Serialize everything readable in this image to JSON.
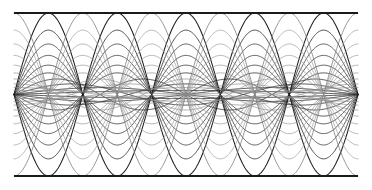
{
  "figure": {
    "name": "standing-wave-harmonic-superposition",
    "background_color": "#ffffff",
    "width": 372,
    "height": 190
  },
  "frame": {
    "top_label": "top boundary",
    "bottom_label": "bottom boundary",
    "color": "#1a1a1a",
    "stroke_width": 1.1,
    "x_left": 14,
    "x_right": 358,
    "y_top": 13,
    "y_bottom": 176,
    "left_border_visible": false,
    "right_border_visible": false
  },
  "chart_data": {
    "type": "line",
    "subtitle": "",
    "xlabel": "",
    "ylabel": "",
    "xlim": [
      0,
      1
    ],
    "ylim": [
      -1,
      1
    ],
    "grid": false,
    "legend": "none",
    "axes_visible": false,
    "tick_labels_x": [],
    "tick_labels_y": [],
    "domain_px": {
      "x0": 14,
      "x1": 358
    },
    "range_px": {
      "y_center": 94.5,
      "y_top": 13,
      "y_bottom": 176
    },
    "half_amplitude_px": 81.5,
    "equation": "y(x) = A_n * sin(n * pi * x / L)",
    "node_count_per_curve_note": "nodes shared at x = k*L/n",
    "samples_per_curve": 420,
    "series": [
      {
        "name": "harmonic-1-up",
        "n": 1,
        "amplitude": 0.05,
        "phase": 0,
        "color": "#262626",
        "width": 0.85,
        "opacity": 1.0
      },
      {
        "name": "harmonic-1-down",
        "n": 1,
        "amplitude": -0.05,
        "phase": 0,
        "color": "#262626",
        "width": 0.85,
        "opacity": 1.0
      },
      {
        "name": "harmonic-2-up",
        "n": 2,
        "amplitude": 0.085,
        "phase": 0,
        "color": "#2b2b2b",
        "width": 0.85,
        "opacity": 1.0
      },
      {
        "name": "harmonic-2-down",
        "n": 2,
        "amplitude": -0.085,
        "phase": 0,
        "color": "#2b2b2b",
        "width": 0.85,
        "opacity": 1.0
      },
      {
        "name": "harmonic-3-up",
        "n": 3,
        "amplitude": 0.13,
        "phase": 0,
        "color": "#303030",
        "width": 0.85,
        "opacity": 1.0
      },
      {
        "name": "harmonic-3-down",
        "n": 3,
        "amplitude": -0.13,
        "phase": 0,
        "color": "#303030",
        "width": 0.85,
        "opacity": 1.0
      },
      {
        "name": "harmonic-4-up",
        "n": 4,
        "amplitude": 0.19,
        "phase": 0,
        "color": "#343434",
        "width": 0.85,
        "opacity": 1.0
      },
      {
        "name": "harmonic-4-down",
        "n": 4,
        "amplitude": -0.19,
        "phase": 0,
        "color": "#343434",
        "width": 0.85,
        "opacity": 1.0
      },
      {
        "name": "harmonic-5-up",
        "n": 5,
        "amplitude": 0.265,
        "phase": 0,
        "color": "#383838",
        "width": 0.85,
        "opacity": 1.0
      },
      {
        "name": "harmonic-5-down",
        "n": 5,
        "amplitude": -0.265,
        "phase": 0,
        "color": "#383838",
        "width": 0.85,
        "opacity": 1.0
      },
      {
        "name": "harmonic-6-up",
        "n": 5,
        "amplitude": 0.36,
        "phase": 0,
        "color": "#3d3d3d",
        "width": 0.85,
        "opacity": 1.0
      },
      {
        "name": "harmonic-6-down",
        "n": 5,
        "amplitude": -0.36,
        "phase": 0,
        "color": "#3d3d3d",
        "width": 0.85,
        "opacity": 1.0
      },
      {
        "name": "harmonic-7-up",
        "n": 5,
        "amplitude": 0.48,
        "phase": 0,
        "color": "#414141",
        "width": 0.85,
        "opacity": 1.0
      },
      {
        "name": "harmonic-7-down",
        "n": 5,
        "amplitude": -0.48,
        "phase": 0,
        "color": "#414141",
        "width": 0.85,
        "opacity": 1.0
      },
      {
        "name": "harmonic-8-up",
        "n": 5,
        "amplitude": 0.62,
        "phase": 0,
        "color": "#454545",
        "width": 0.85,
        "opacity": 1.0
      },
      {
        "name": "harmonic-8-down",
        "n": 5,
        "amplitude": -0.62,
        "phase": 0,
        "color": "#454545",
        "width": 0.85,
        "opacity": 1.0
      },
      {
        "name": "harmonic-9-up",
        "n": 5,
        "amplitude": 0.79,
        "phase": 0,
        "color": "#3a3a3a",
        "width": 0.9,
        "opacity": 1.0
      },
      {
        "name": "harmonic-9-down",
        "n": 5,
        "amplitude": -0.79,
        "phase": 0,
        "color": "#3a3a3a",
        "width": 0.9,
        "opacity": 1.0
      },
      {
        "name": "harmonic-10-up",
        "n": 5,
        "amplitude": 1.0,
        "phase": 0,
        "color": "#1f1f1f",
        "width": 1.05,
        "opacity": 1.0
      },
      {
        "name": "harmonic-10-down",
        "n": 5,
        "amplitude": -1.0,
        "phase": 0,
        "color": "#1f1f1f",
        "width": 1.05,
        "opacity": 1.0
      },
      {
        "name": "shifted-1-up",
        "n": 1,
        "amplitude": 0.05,
        "phase": 0.5,
        "color": "#8a8a8a",
        "width": 0.8,
        "opacity": 0.95
      },
      {
        "name": "shifted-1-down",
        "n": 1,
        "amplitude": -0.05,
        "phase": 0.5,
        "color": "#8a8a8a",
        "width": 0.8,
        "opacity": 0.95
      },
      {
        "name": "shifted-2-up",
        "n": 2,
        "amplitude": 0.085,
        "phase": 0.5,
        "color": "#8d8d8d",
        "width": 0.8,
        "opacity": 0.95
      },
      {
        "name": "shifted-2-down",
        "n": 2,
        "amplitude": -0.085,
        "phase": 0.5,
        "color": "#8d8d8d",
        "width": 0.8,
        "opacity": 0.95
      },
      {
        "name": "shifted-3-up",
        "n": 3,
        "amplitude": 0.13,
        "phase": 0.5,
        "color": "#909090",
        "width": 0.8,
        "opacity": 0.95
      },
      {
        "name": "shifted-3-down",
        "n": 3,
        "amplitude": -0.13,
        "phase": 0.5,
        "color": "#909090",
        "width": 0.8,
        "opacity": 0.95
      },
      {
        "name": "shifted-4-up",
        "n": 4,
        "amplitude": 0.19,
        "phase": 0.5,
        "color": "#939393",
        "width": 0.8,
        "opacity": 0.95
      },
      {
        "name": "shifted-4-down",
        "n": 4,
        "amplitude": -0.19,
        "phase": 0.5,
        "color": "#939393",
        "width": 0.8,
        "opacity": 0.95
      },
      {
        "name": "shifted-5-up",
        "n": 5,
        "amplitude": 0.265,
        "phase": 0.5,
        "color": "#969696",
        "width": 0.8,
        "opacity": 0.95
      },
      {
        "name": "shifted-5-down",
        "n": 5,
        "amplitude": -0.265,
        "phase": 0.5,
        "color": "#969696",
        "width": 0.8,
        "opacity": 0.95
      },
      {
        "name": "shifted-6-up",
        "n": 5,
        "amplitude": 0.36,
        "phase": 0.5,
        "color": "#999999",
        "width": 0.8,
        "opacity": 0.95
      },
      {
        "name": "shifted-6-down",
        "n": 5,
        "amplitude": -0.36,
        "phase": 0.5,
        "color": "#999999",
        "width": 0.8,
        "opacity": 0.95
      },
      {
        "name": "shifted-7-up",
        "n": 5,
        "amplitude": 0.48,
        "phase": 0.5,
        "color": "#9c9c9c",
        "width": 0.8,
        "opacity": 0.95
      },
      {
        "name": "shifted-7-down",
        "n": 5,
        "amplitude": -0.48,
        "phase": 0.5,
        "color": "#9c9c9c",
        "width": 0.8,
        "opacity": 0.95
      },
      {
        "name": "shifted-8-up",
        "n": 5,
        "amplitude": 0.62,
        "phase": 0.5,
        "color": "#9f9f9f",
        "width": 0.8,
        "opacity": 0.95
      },
      {
        "name": "shifted-8-down",
        "n": 5,
        "amplitude": -0.62,
        "phase": 0.5,
        "color": "#9f9f9f",
        "width": 0.8,
        "opacity": 0.95
      },
      {
        "name": "shifted-9-up",
        "n": 5,
        "amplitude": 0.79,
        "phase": 0.5,
        "color": "#a2a2a2",
        "width": 0.8,
        "opacity": 0.95
      },
      {
        "name": "shifted-9-down",
        "n": 5,
        "amplitude": -0.79,
        "phase": 0.5,
        "color": "#a2a2a2",
        "width": 0.8,
        "opacity": 0.95
      },
      {
        "name": "shifted-10-up",
        "n": 5,
        "amplitude": 1.0,
        "phase": 0.5,
        "color": "#7d7d7d",
        "width": 0.85,
        "opacity": 0.95
      },
      {
        "name": "shifted-10-down",
        "n": 5,
        "amplitude": -1.0,
        "phase": 0.5,
        "color": "#7d7d7d",
        "width": 0.85,
        "opacity": 0.95
      }
    ]
  }
}
